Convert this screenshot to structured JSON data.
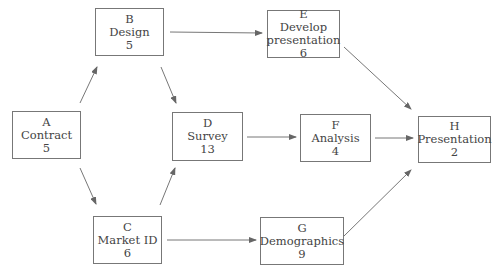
{
  "nodes": {
    "A": {
      "id": "A",
      "name": "Contract",
      "duration": "5"
    },
    "B": {
      "id": "B",
      "name": "Design",
      "duration": "5"
    },
    "C": {
      "id": "C",
      "name": "Market ID",
      "duration": "6"
    },
    "D": {
      "id": "D",
      "name": "Survey",
      "duration": "13"
    },
    "E": {
      "id": "E",
      "name_line1": "Develop",
      "name_line2": "presentation",
      "duration": "6"
    },
    "F": {
      "id": "F",
      "name": "Analysis",
      "duration": "4"
    },
    "G": {
      "id": "G",
      "name": "Demographics",
      "duration": "9"
    },
    "H": {
      "id": "H",
      "name": "Presentation",
      "duration": "2"
    }
  },
  "edges": [
    [
      "A",
      "B"
    ],
    [
      "A",
      "C"
    ],
    [
      "B",
      "D"
    ],
    [
      "B",
      "E"
    ],
    [
      "C",
      "D"
    ],
    [
      "C",
      "G"
    ],
    [
      "D",
      "F"
    ],
    [
      "E",
      "H"
    ],
    [
      "F",
      "H"
    ],
    [
      "G",
      "H"
    ]
  ]
}
